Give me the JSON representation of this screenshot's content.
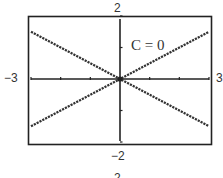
{
  "chart_data": {
    "type": "line",
    "title": "",
    "xlabel": "",
    "ylabel": "",
    "xlim": [
      -3,
      3
    ],
    "ylim": [
      -2,
      2
    ],
    "grid": false,
    "legend": null,
    "axis_labels": {
      "xmin": "−3",
      "xmax": "3",
      "ymin": "−2",
      "ymax": "2"
    },
    "x_ticks": [
      -3,
      -2,
      -1,
      0,
      1,
      2,
      3
    ],
    "y_ticks": [
      -2,
      -1,
      0,
      1,
      2
    ],
    "annotation": "C = 0",
    "series": [
      {
        "name": "y = x/2",
        "x": [
          -3,
          3
        ],
        "y": [
          -1.5,
          1.5
        ],
        "style": "dotted"
      },
      {
        "name": "y = -x/2",
        "x": [
          -3,
          3
        ],
        "y": [
          1.5,
          -1.5
        ],
        "style": "dotted"
      }
    ],
    "intersection": {
      "x": 0,
      "y": 0
    }
  },
  "page": {
    "partial_caption": "2"
  },
  "colors": {
    "frame": "#222222",
    "axes": "#222222",
    "lines": "#333333",
    "text": "#333333"
  }
}
